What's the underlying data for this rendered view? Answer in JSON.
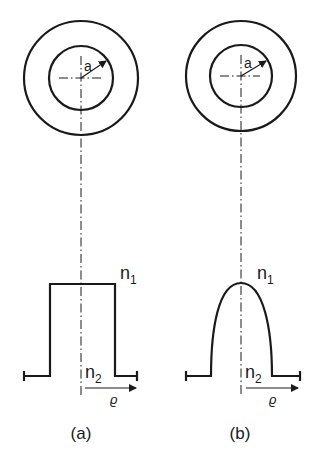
{
  "figure": {
    "panels": [
      {
        "id": "a",
        "caption": "(a)",
        "profile_type": "step-index",
        "radius_label": "a",
        "core_index_label": "n",
        "core_index_sub": "1",
        "cladding_index_label": "n",
        "cladding_index_sub": "2",
        "radial_axis_label": "ϱ"
      },
      {
        "id": "b",
        "caption": "(b)",
        "profile_type": "graded-index",
        "radius_label": "a",
        "core_index_label": "n",
        "core_index_sub": "1",
        "cladding_index_label": "n",
        "cladding_index_sub": "2",
        "radial_axis_label": "ϱ"
      }
    ],
    "colors": {
      "ink": "#1a1a1a",
      "background": "#ffffff"
    }
  }
}
